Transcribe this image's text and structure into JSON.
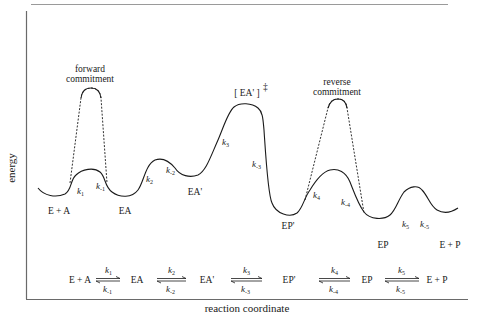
{
  "diagram": {
    "type": "reaction-energy-profile",
    "axes": {
      "x_label": "reaction coordinate",
      "y_label": "energy"
    },
    "annotations": {
      "forward_commitment": [
        "forward",
        "commitment"
      ],
      "reverse_commitment": [
        "reverse",
        "commitment"
      ],
      "transition_state": "[ EA' ]",
      "transition_state_mark": "‡"
    },
    "species": {
      "s1": "E + A",
      "s2": "EA",
      "s3": "EA'",
      "s4": "EP'",
      "s5": "EP",
      "s6": "E + P"
    },
    "curve_rate_labels": [
      {
        "k": "k",
        "sub": "1"
      },
      {
        "k": "k",
        "sub": "-1"
      },
      {
        "k": "k",
        "sub": "2"
      },
      {
        "k": "k",
        "sub": "-2"
      },
      {
        "k": "k",
        "sub": "3"
      },
      {
        "k": "k",
        "sub": "-3"
      },
      {
        "k": "k",
        "sub": "4"
      },
      {
        "k": "k",
        "sub": "-4"
      },
      {
        "k": "k",
        "sub": "5"
      },
      {
        "k": "k",
        "sub": "-5"
      }
    ],
    "scheme": {
      "species": [
        "E + A",
        "EA",
        "EA'",
        "EP'",
        "EP",
        "E + P"
      ],
      "forward": [
        "1",
        "2",
        "3",
        "4",
        "5"
      ],
      "reverse": [
        "-1",
        "-2",
        "-3",
        "-4",
        "-5"
      ],
      "k": "k"
    },
    "colors": {
      "line": "#1a1a1a",
      "frame": "#7a7a7a"
    }
  }
}
